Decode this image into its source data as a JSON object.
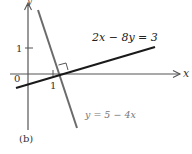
{
  "figure": {
    "caption": "(b)",
    "axes": {
      "x_label": "x",
      "y_label": "y",
      "origin_label": "0",
      "x_tick_label": "1",
      "y_tick_label": "1"
    },
    "lines": [
      {
        "equation": "2x − 8y = 3",
        "color": "#1a1a1a",
        "style": "thick"
      },
      {
        "equation": "y = 5 − 4x",
        "color": "#6b6b6b",
        "style": "thick"
      }
    ],
    "annotations": {
      "right_angle": "perpendicular-marker"
    }
  }
}
